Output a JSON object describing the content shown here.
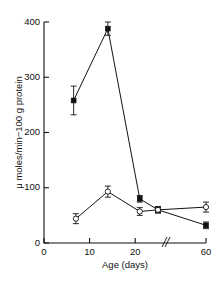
{
  "chart_data": {
    "type": "line",
    "title": "",
    "subtitle": "",
    "xlabel": "Age  (days)",
    "ylabel": "μ moles/min−70 g protein",
    "ylabel_text": "μ moles/min−100 g protein",
    "xlim": [
      0,
      60
    ],
    "ylim": [
      0,
      400
    ],
    "ytick_labels": [
      "0",
      "100",
      "200",
      "300",
      "400"
    ],
    "ytick_values": [
      0,
      100,
      200,
      300,
      400
    ],
    "xtick_labels": [
      "0",
      "10",
      "20",
      "60"
    ],
    "xtick_values": [
      0,
      10,
      20,
      60
    ],
    "axis_break": true,
    "axis_break_between": [
      25,
      60
    ],
    "axis_break_symbol": "≠",
    "grid": false,
    "legend": "none",
    "line_color": "#111111",
    "series": [
      {
        "name": "filled-square-series",
        "marker": "filled-square",
        "x": [
          6.5,
          14,
          21,
          25,
          60
        ],
        "values": [
          258,
          388,
          80,
          60,
          32
        ],
        "errors": [
          26,
          12,
          6,
          5,
          6
        ]
      },
      {
        "name": "open-circle-series",
        "marker": "open-circle",
        "x": [
          7,
          14,
          21,
          25,
          60
        ],
        "values": [
          44,
          93,
          57,
          60,
          65
        ],
        "errors": [
          9,
          10,
          7,
          6,
          9
        ]
      }
    ]
  },
  "figure": {
    "caption": "",
    "background": "#ffffff"
  }
}
